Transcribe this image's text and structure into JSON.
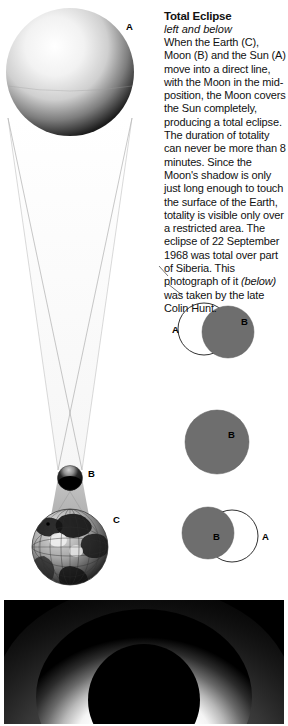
{
  "article": {
    "title": "Total Eclipse",
    "kicker": "left and below",
    "body_before_italic": "When the Earth (C), Moon (B) and the Sun (A) move into a direct line, with the Moon in the mid-position, the Moon covers the Sun completely, producing a total eclipse. The duration of totality can never be more than 8 minutes. Since the Moon's shadow is only just long enough to touch the surface of the Earth, totality is visible only over a restricted area. The eclipse of 22 September 1968 was total over part of Siberia. This photograph of it",
    "body_italic": "(below)",
    "body_after_italic": " was taken by the late Colin Hunt."
  },
  "diagram": {
    "sun_label": "A",
    "moon_label": "B",
    "earth_label": "C",
    "sun_name": "Sun",
    "moon_name": "Moon",
    "earth_name": "Earth"
  },
  "phases": [
    {
      "id": "phase-partial-start",
      "left_label": "A",
      "right_label": "B"
    },
    {
      "id": "phase-totality",
      "center_label": "B"
    },
    {
      "id": "phase-partial-end",
      "left_label": "B",
      "right_label": "A"
    }
  ],
  "photo": {
    "caption_alt": "total solar eclipse corona photograph"
  },
  "colors": {
    "disc_gray": "#6e6e6e",
    "outline": "#1a1a1a",
    "cone": "#d9d9d9",
    "background": "#ffffff",
    "photo_black": "#000000",
    "corona": "#ffffff"
  }
}
